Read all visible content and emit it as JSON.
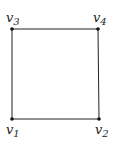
{
  "diagram": {
    "type": "square-graph",
    "line_color": "#222222",
    "vertices": [
      {
        "id": "v1",
        "name": "v",
        "index": "1",
        "x": 12,
        "y": 119
      },
      {
        "id": "v2",
        "name": "v",
        "index": "2",
        "x": 99,
        "y": 119
      },
      {
        "id": "v3",
        "name": "v",
        "index": "3",
        "x": 12,
        "y": 29
      },
      {
        "id": "v4",
        "name": "v",
        "index": "4",
        "x": 98,
        "y": 29
      }
    ],
    "edges": [
      [
        "v1",
        "v2"
      ],
      [
        "v2",
        "v4"
      ],
      [
        "v4",
        "v3"
      ],
      [
        "v3",
        "v1"
      ]
    ]
  }
}
